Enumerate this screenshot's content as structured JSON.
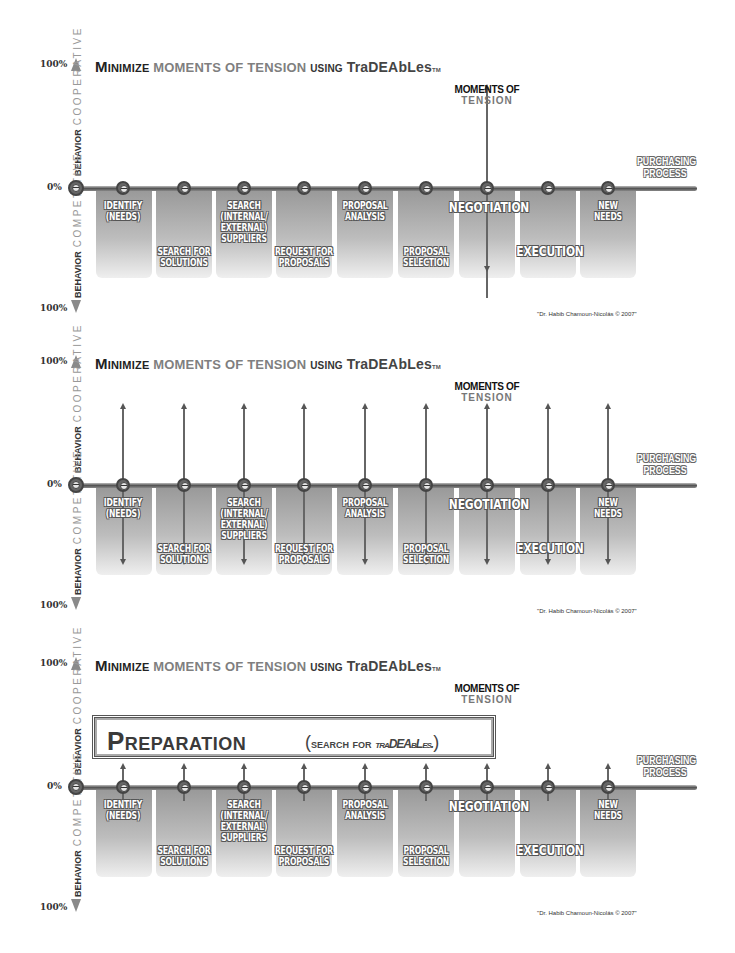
{
  "panels": [
    {
      "title": {
        "part1": "Minimize",
        "part2": "MOMENTS OF TENSION",
        "part3": "using",
        "part4": "TraDEAbLes",
        "tm": "TM"
      },
      "variant": "single-tension",
      "preparation": null
    },
    {
      "title": {
        "part1": "Minimize",
        "part2": "MOMENTS OF TENSION",
        "part3": "using",
        "part4": "TraDEAbLes",
        "tm": "TM"
      },
      "variant": "all-tension",
      "preparation": null
    },
    {
      "title": {
        "part1": "Minimize",
        "part2": "MOMENTS OF TENSION",
        "part3": "using",
        "part4": "TraDEAbLes",
        "tm": "TM"
      },
      "variant": "preparation",
      "preparation": {
        "main": "Preparation",
        "sub_open": "(",
        "sub_text": "search for",
        "sub_tradeables": "traDEAbLes.",
        "sub_close": ")"
      }
    }
  ],
  "axis": {
    "top_pct": "100%",
    "zero_pct": "0%",
    "bottom_pct": "100%",
    "upper_label_bold": "BEHAVIOR",
    "upper_label_light": "COOPERATIVE",
    "lower_label_bold": "BEHAVIOR",
    "lower_label_light": "COMPETITIVE",
    "process_label_line1": "PURCHASING",
    "process_label_line2": "PROCESS"
  },
  "moments_of_tension": {
    "line1": "MOMENTS OF",
    "line2": "TENSION"
  },
  "stages": [
    {
      "lines": [
        "IDENTIFY",
        "(NEEDS)"
      ],
      "pos": "top"
    },
    {
      "lines": [
        "SEARCH FOR",
        "SOLUTIONS"
      ],
      "pos": "bottom"
    },
    {
      "lines": [
        "SEARCH",
        "(INTERNAL/",
        "EXTERNAL)",
        "SUPPLIERS"
      ],
      "pos": "top"
    },
    {
      "lines": [
        "REQUEST FOR",
        "PROPOSALS"
      ],
      "pos": "bottom"
    },
    {
      "lines": [
        "PROPOSAL",
        "ANALYSIS"
      ],
      "pos": "top"
    },
    {
      "lines": [
        "PROPOSAL",
        "SELECTION"
      ],
      "pos": "bottom"
    },
    {
      "lines": [
        "NEGOTIATION"
      ],
      "pos": "top-big"
    },
    {
      "lines": [
        "EXECUTION"
      ],
      "pos": "bottom-big"
    },
    {
      "lines": [
        "NEW",
        "NEEDS"
      ],
      "pos": "top"
    }
  ],
  "credit": "\"Dr. Habib Chamoun-Nicolás © 2007\""
}
